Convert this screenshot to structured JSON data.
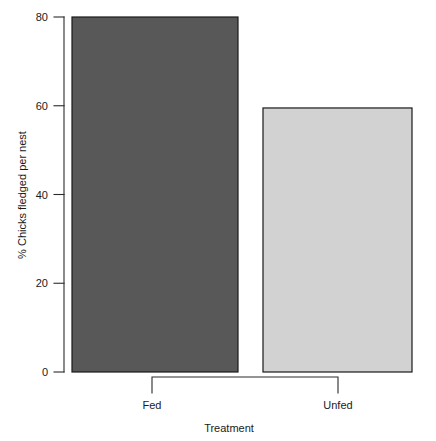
{
  "chart_data": {
    "type": "bar",
    "title": "",
    "categories": [
      "Fed",
      "Unfed"
    ],
    "values": [
      80,
      59.5
    ],
    "series": [
      {
        "name": "% Chicks fledged per nest",
        "values": [
          80,
          59.5
        ]
      }
    ],
    "xlabel": "Treatment",
    "ylabel": "% Chicks fledged  per nest",
    "ylim": [
      0,
      80
    ],
    "yticks": [
      0,
      20,
      40,
      60,
      80
    ],
    "ytick_labels": [
      "0",
      "20",
      "40",
      "60",
      "80"
    ],
    "grid": false,
    "legend": false,
    "bar_colors": [
      "#585858",
      "#d2d2d2"
    ],
    "bar_border_color": "#1a1a1a",
    "axis_color": "#2b2b2b",
    "background": "#ffffff"
  },
  "axis": {
    "y_title": "% Chicks fledged  per nest",
    "x_title": "Treatment",
    "tick_0": "0",
    "tick_20": "20",
    "tick_40": "40",
    "tick_60": "60",
    "tick_80": "80"
  },
  "bars": {
    "fed": {
      "label": "Fed",
      "value": "80"
    },
    "unfed": {
      "label": "Unfed",
      "value": "59.5"
    }
  }
}
